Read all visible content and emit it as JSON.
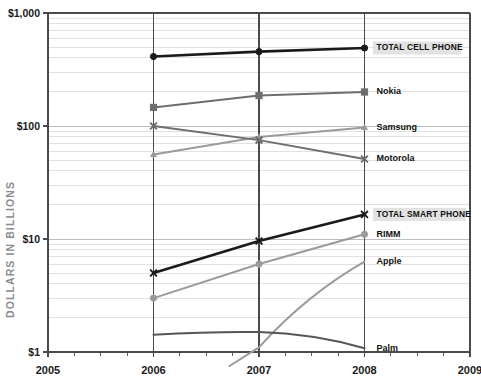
{
  "chart_data": {
    "type": "line",
    "title": "",
    "xlabel": "",
    "ylabel": "DOLLARS IN BILLIONS",
    "yscale": "log",
    "ylim": [
      1,
      1000
    ],
    "xlim": [
      2005,
      2009
    ],
    "grid": true,
    "legend_position": "right-inline-labels",
    "x_tick_labels": [
      "2005",
      "2006",
      "2007",
      "2008",
      "2009"
    ],
    "y_tick_labels": [
      "$1,000",
      "$100",
      "$10",
      "$1"
    ],
    "y_tick_values": [
      1000,
      100,
      10,
      1
    ],
    "x": [
      2006,
      2007,
      2008
    ],
    "series": [
      {
        "name": "TOTAL CELL PHONE",
        "label": "TOTAL CELL PHONE",
        "emphasis": true,
        "color": "#1a1a1a",
        "marker": "circle",
        "values": [
          412,
          455,
          490
        ]
      },
      {
        "name": "Nokia",
        "label": "Nokia",
        "emphasis": false,
        "color": "#6e6e6e",
        "marker": "square",
        "values": [
          146,
          186,
          200
        ]
      },
      {
        "name": "Samsung",
        "label": "Samsung",
        "emphasis": false,
        "color": "#9a9a9a",
        "marker": "triangle",
        "values": [
          56,
          80,
          97
        ]
      },
      {
        "name": "Motorola",
        "label": "Motorola",
        "emphasis": false,
        "color": "#6e6e6e",
        "marker": "x",
        "values": [
          100,
          75,
          51
        ]
      },
      {
        "name": "TOTAL SMART PHONE",
        "label": "TOTAL SMART PHONE",
        "emphasis": true,
        "color": "#1a1a1a",
        "marker": "x",
        "values": [
          5.0,
          9.6,
          16.5
        ]
      },
      {
        "name": "RIMM",
        "label": "RIMM",
        "emphasis": false,
        "color": "#9a9a9a",
        "marker": "circle",
        "values": [
          3.0,
          6.0,
          11.0
        ]
      },
      {
        "name": "Apple",
        "label": "Apple",
        "emphasis": false,
        "color": "#9a9a9a",
        "marker": "none",
        "values": [
          null,
          1.1,
          6.3
        ]
      },
      {
        "name": "Palm",
        "label": "Palm",
        "emphasis": false,
        "color": "#555555",
        "marker": "none",
        "values": [
          1.42,
          1.5,
          1.08
        ]
      }
    ]
  },
  "axis": {
    "y_label": "DOLLARS IN BILLIONS",
    "y_ticks": [
      {
        "label": "$1,000",
        "value": 1000
      },
      {
        "label": "$100",
        "value": 100
      },
      {
        "label": "$10",
        "value": 10
      },
      {
        "label": "$1",
        "value": 1
      }
    ],
    "x_ticks": [
      {
        "label": "2005",
        "value": 2005
      },
      {
        "label": "2006",
        "value": 2006
      },
      {
        "label": "2007",
        "value": 2007
      },
      {
        "label": "2008",
        "value": 2008
      },
      {
        "label": "2009",
        "value": 2009
      }
    ]
  },
  "colors": {
    "ink": "#1a1a1a",
    "mid_gray": "#6e6e6e",
    "light_gray": "#9a9a9a",
    "grid": "#d9d9d9",
    "axis_label_gray": "#8c8c8c",
    "highlight_bg": "#e2e2e2"
  }
}
